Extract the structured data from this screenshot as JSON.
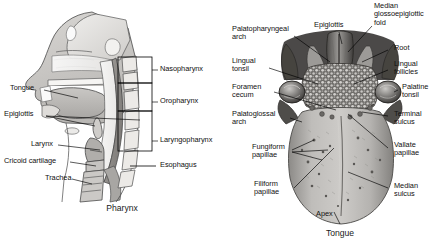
{
  "figure": {
    "background_color": "#ffffff",
    "ink_color": "#000000"
  },
  "pharynx_panel": {
    "caption": "Pharynx",
    "left_labels": [
      {
        "id": "tongue",
        "text": "Tongue",
        "x": 10,
        "y": 88
      },
      {
        "id": "epiglottis",
        "text": "Epiglottis",
        "x": 4,
        "y": 113
      },
      {
        "id": "larynx",
        "text": "Larynx",
        "x": 31,
        "y": 142
      },
      {
        "id": "cricoid-cartilage",
        "text": "Cricoid cartilage",
        "x": 4,
        "y": 159
      },
      {
        "id": "trachea",
        "text": "Trachea",
        "x": 45,
        "y": 176
      }
    ],
    "bracket_labels": [
      {
        "id": "nasopharynx",
        "text": "Nasopharynx",
        "x": 160,
        "y": 68
      },
      {
        "id": "oropharynx",
        "text": "Oropharynx",
        "x": 160,
        "y": 100
      },
      {
        "id": "laryngopharynx",
        "text": "Laryngopharynx",
        "x": 160,
        "y": 139
      },
      {
        "id": "esophagus",
        "text": "Esophagus",
        "x": 160,
        "y": 164
      }
    ]
  },
  "tongue_panel": {
    "caption": "Tongue",
    "left_labels": [
      {
        "id": "palatopharyngeal-arch",
        "text": "Palatopharyngeal\narch",
        "x": 10,
        "y": 28
      },
      {
        "id": "lingual-tonsil",
        "text": "Lingual\ntonsil",
        "x": 10,
        "y": 60
      },
      {
        "id": "foramen-cecum",
        "text": "Foramen\ncecum",
        "x": 10,
        "y": 86
      },
      {
        "id": "palatoglossal-arch",
        "text": "Palatoglossal\narch",
        "x": 10,
        "y": 113
      },
      {
        "id": "fungiform-papillae",
        "text": "Fungiform\npapillae",
        "x": 30,
        "y": 146
      },
      {
        "id": "filiform-papillae",
        "text": "Filiform\npapillae",
        "x": 32,
        "y": 183
      }
    ],
    "top_labels": [
      {
        "id": "epiglottis",
        "text": "Epiglottis",
        "x": 95,
        "y": 23
      },
      {
        "id": "median-glossoepiglottic-fold",
        "text": "Median\nglossoepiglottic\nfold",
        "x": 154,
        "y": 4
      }
    ],
    "right_labels": [
      {
        "id": "root",
        "text": "Root",
        "x": 170,
        "y": 47
      },
      {
        "id": "lingual-follicles",
        "text": "Lingual\nfollicles",
        "x": 170,
        "y": 62
      },
      {
        "id": "palatine-tonsil",
        "text": "Palatine\ntonsil",
        "x": 178,
        "y": 85
      },
      {
        "id": "terminal-sulcus",
        "text": "Terminal\nsulcus",
        "x": 170,
        "y": 112
      },
      {
        "id": "vallate-papillae",
        "text": "Vallate\npapillae",
        "x": 170,
        "y": 143
      },
      {
        "id": "median-sulcus",
        "text": "Median\nsulcus",
        "x": 170,
        "y": 185
      }
    ],
    "bottom_labels": [
      {
        "id": "apex",
        "text": "Apex",
        "x": 94,
        "y": 213
      }
    ]
  }
}
